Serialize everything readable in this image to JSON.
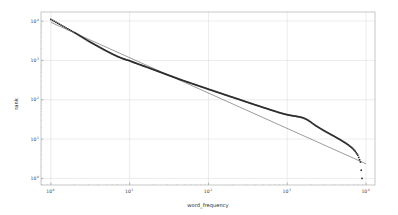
{
  "chart_data": {
    "type": "scatter",
    "title": "",
    "xlabel": "word_frequency",
    "ylabel": "rank",
    "xscale": "log",
    "yscale": "log",
    "xlim": [
      0.75,
      13000
    ],
    "ylim": [
      0.68,
      17000
    ],
    "grid": true,
    "legend": null,
    "xticks": [
      1,
      10,
      100,
      1000,
      10000
    ],
    "xticklabels": [
      "10^0",
      "10^1",
      "10^2",
      "10^3",
      "10^4"
    ],
    "yticks": [
      1,
      10,
      100,
      1000,
      10000
    ],
    "yticklabels": [
      "10^0",
      "10^1",
      "10^2",
      "10^3",
      "10^4"
    ],
    "tick_base": "10",
    "tick_exponents": [
      "0",
      "1",
      "2",
      "3",
      "4"
    ],
    "marker_color": "#2b2b2b",
    "marker_size": 1.6,
    "line_color": "#4a4a4a",
    "grid_color": "#d8d8d8",
    "axes_color": "#b0b0b0",
    "background_color": "#ffffff",
    "series": [
      {
        "name": "rank_vs_frequency",
        "kind": "scatter",
        "points": [
          [
            1,
            11000
          ],
          [
            2,
            5100
          ],
          [
            3,
            3100
          ],
          [
            4,
            2250
          ],
          [
            5,
            1760
          ],
          [
            6,
            1460
          ],
          [
            7,
            1260
          ],
          [
            8,
            1130
          ],
          [
            9,
            1040
          ],
          [
            10,
            980
          ],
          [
            11,
            905
          ],
          [
            12,
            850
          ],
          [
            13,
            800
          ],
          [
            14,
            760
          ],
          [
            15,
            720
          ],
          [
            16,
            690
          ],
          [
            17,
            660
          ],
          [
            18,
            632
          ],
          [
            19,
            607
          ],
          [
            20,
            585
          ],
          [
            22,
            545
          ],
          [
            24,
            510
          ],
          [
            26,
            480
          ],
          [
            28,
            455
          ],
          [
            30,
            432
          ],
          [
            33,
            402
          ],
          [
            36,
            378
          ],
          [
            39,
            356
          ],
          [
            42,
            336
          ],
          [
            45,
            320
          ],
          [
            49,
            302
          ],
          [
            53,
            286
          ],
          [
            57,
            272
          ],
          [
            62,
            257
          ],
          [
            67,
            244
          ],
          [
            72,
            232
          ],
          [
            78,
            220
          ],
          [
            84,
            209
          ],
          [
            91,
            198
          ],
          [
            98,
            188
          ],
          [
            106,
            178
          ],
          [
            114,
            170
          ],
          [
            123,
            161
          ],
          [
            133,
            153
          ],
          [
            143,
            146
          ],
          [
            155,
            138
          ],
          [
            167,
            131
          ],
          [
            180,
            125
          ],
          [
            195,
            118
          ],
          [
            210,
            113
          ],
          [
            227,
            107
          ],
          [
            245,
            102
          ],
          [
            265,
            96.5
          ],
          [
            286,
            91.5
          ],
          [
            309,
            87
          ],
          [
            334,
            82.5
          ],
          [
            360,
            78.5
          ],
          [
            389,
            74.5
          ],
          [
            420,
            71
          ],
          [
            454,
            67.5
          ],
          [
            490,
            64
          ],
          [
            530,
            61
          ],
          [
            572,
            58
          ],
          [
            618,
            55
          ],
          [
            668,
            52.5
          ],
          [
            721,
            50
          ],
          [
            779,
            47.5
          ],
          [
            842,
            45.5
          ],
          [
            909,
            43.5
          ],
          [
            982,
            42
          ],
          [
            1061,
            40.5
          ],
          [
            1146,
            39.5
          ],
          [
            1238,
            38.5
          ],
          [
            1337,
            37.5
          ],
          [
            1444,
            36.5
          ],
          [
            1560,
            35
          ],
          [
            1685,
            33
          ],
          [
            1820,
            30.5
          ],
          [
            1966,
            27.5
          ],
          [
            2124,
            24.5
          ],
          [
            2294,
            22
          ],
          [
            2478,
            20
          ],
          [
            2677,
            18.2
          ],
          [
            2892,
            16.6
          ],
          [
            3124,
            15.2
          ],
          [
            3374,
            14
          ],
          [
            3644,
            12.8
          ],
          [
            3936,
            11.8
          ],
          [
            4251,
            10.8
          ],
          [
            4591,
            9.9
          ],
          [
            4958,
            9.0
          ],
          [
            5355,
            8.2
          ],
          [
            5784,
            7.4
          ],
          [
            6247,
            6.6
          ],
          [
            6747,
            5.8
          ],
          [
            7287,
            4.9
          ],
          [
            7870,
            3.9
          ],
          [
            8500,
            2.6
          ],
          [
            8900,
            1.0
          ]
        ]
      },
      {
        "name": "power_law_fit",
        "kind": "line",
        "points": [
          [
            1,
            9300
          ],
          [
            10000,
            2.35
          ]
        ],
        "slope": -0.9,
        "intercept_log10": 3.969
      }
    ]
  },
  "figure": {
    "axis_label_x": "word_frequency",
    "axis_label_y": "rank"
  }
}
